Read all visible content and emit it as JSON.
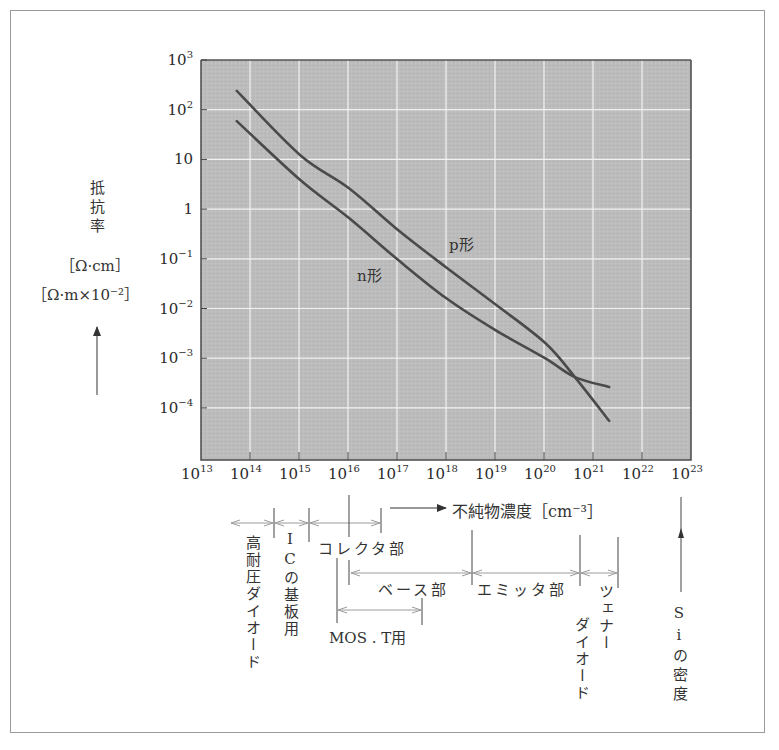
{
  "figure": {
    "y_axis_title": [
      "抵",
      "抗",
      "率"
    ],
    "y_unit_1": "［Ω·cm］",
    "y_unit_2": "［Ω·m×10⁻²］",
    "x_axis_title": "不純物濃度［cm⁻³］",
    "curve_labels": {
      "p": "p形",
      "n": "n形"
    },
    "annotations": {
      "high_voltage_diode": "高耐圧ダイオード",
      "ic_substrate": "ICの基板用",
      "collector": "コレクタ部",
      "base": "ベース部",
      "emitter": "エミッタ部",
      "mos_t": "MOS . T用",
      "zener_diode_1": "ツェナー",
      "zener_diode_2": "ダイオード",
      "si_density": "Siの密度"
    },
    "colors": {
      "plot_background": "#b9b9b9",
      "gridline": "#f2f2f2",
      "curve": "#4a4a4a",
      "bracket": "#9c9c9c",
      "frame": "#9a9a9a"
    }
  },
  "chart_data": {
    "type": "line",
    "title": "",
    "xlabel": "不純物濃度 [cm⁻³]",
    "ylabel": "抵抗率 [Ω·cm] [Ω·m×10⁻²]",
    "xscale": "log",
    "yscale": "log",
    "xlim": [
      10000000000000.0,
      1e+23
    ],
    "ylim": [
      1e-05,
      1000.0
    ],
    "grid": true,
    "x_tick_labels": [
      "10¹³",
      "10¹⁴",
      "10¹⁵",
      "10¹⁶",
      "10¹⁷",
      "10¹⁸",
      "10¹⁹",
      "10²⁰",
      "10²¹",
      "10²²",
      "10²³"
    ],
    "y_tick_labels": [
      "10³",
      "10²",
      "10",
      "1",
      "10⁻¹",
      "10⁻²",
      "10⁻³",
      "10⁻⁴"
    ],
    "series": [
      {
        "name": "p形",
        "log10_x": [
          13.73,
          15.02,
          16.02,
          17.02,
          18.0,
          19.0,
          20.02,
          20.63,
          21.33
        ],
        "log10_y": [
          2.38,
          1.09,
          0.42,
          -0.42,
          -1.17,
          -1.91,
          -2.69,
          -3.38,
          -4.26
        ]
      },
      {
        "name": "n形",
        "log10_x": [
          13.73,
          15.02,
          16.02,
          17.02,
          18.0,
          19.0,
          20.02,
          20.63,
          21.33
        ],
        "log10_y": [
          1.77,
          0.59,
          -0.18,
          -1.02,
          -1.79,
          -2.43,
          -3.0,
          -3.38,
          -3.58
        ]
      }
    ],
    "annotations": [
      {
        "label": "高耐圧ダイオード",
        "range_log10_x": [
          13.6,
          14.5
        ]
      },
      {
        "label": "ICの基板用",
        "range_log10_x": [
          14.5,
          15.2
        ]
      },
      {
        "label": "コレクタ部",
        "range_log10_x": [
          15.2,
          16.6
        ]
      },
      {
        "label": "ベース部",
        "range_log10_x": [
          16.0,
          18.5
        ]
      },
      {
        "label": "エミッタ部",
        "range_log10_x": [
          18.5,
          20.7
        ]
      },
      {
        "label": "ツェナーダイオード",
        "range_log10_x": [
          20.7,
          21.5
        ]
      },
      {
        "label": "MOS.T用",
        "range_log10_x": [
          15.8,
          17.5
        ]
      },
      {
        "label": "Siの密度",
        "log10_x": 22.8
      }
    ]
  }
}
